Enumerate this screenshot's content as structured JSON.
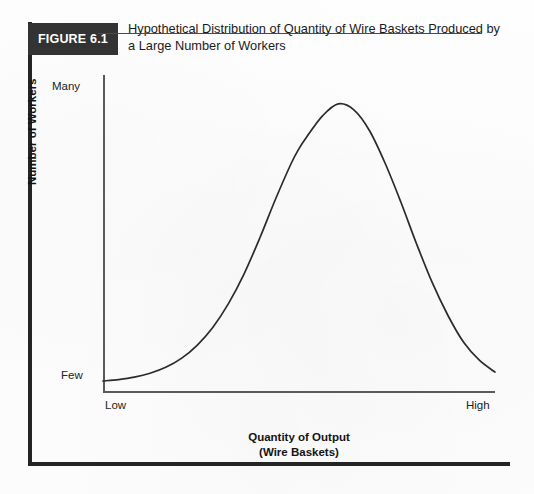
{
  "figure": {
    "badge_label": "FIGURE 6.1",
    "caption_line1": "Hypothetical Distribution of Quantity of Wire Baskets Produced by",
    "caption_line2": "a Large Number of Workers",
    "badge_bg_color": "#333333",
    "badge_text_color": "#ffffff",
    "curve_color": "#2b2b2b",
    "axis_color": "#5a5a5a",
    "border_color": "#242424"
  },
  "chart_data": {
    "type": "line",
    "title": "Hypothetical Distribution of Quantity of Wire Baskets Produced by a Large Number of Workers",
    "xlabel_line1": "Quantity of Output",
    "xlabel_line2": "(Wire Baskets)",
    "ylabel": "Number of Workers",
    "x_tick_labels": [
      "Low",
      "High"
    ],
    "y_tick_labels": [
      "Few",
      "Many"
    ],
    "xlim": [
      0,
      100
    ],
    "ylim": [
      0,
      100
    ],
    "grid": false,
    "legend": null,
    "annotations": [],
    "series": [
      {
        "name": "Number of Workers",
        "description": "Symmetric bell-shaped normal distribution peaking near the middle of the output range",
        "x": [
          0,
          4,
          8,
          12,
          16,
          20,
          24,
          28,
          32,
          36,
          40,
          44,
          48,
          50,
          52,
          56,
          60,
          64,
          68,
          72,
          76,
          80,
          84,
          88,
          92,
          96,
          100
        ],
        "y": [
          2,
          2.5,
          3.3,
          4.6,
          6.6,
          9.6,
          14,
          20,
          28,
          38,
          50,
          63,
          75,
          80,
          84,
          91,
          95,
          93,
          86,
          75,
          62,
          48,
          35,
          24,
          15,
          9,
          5
        ]
      }
    ]
  }
}
